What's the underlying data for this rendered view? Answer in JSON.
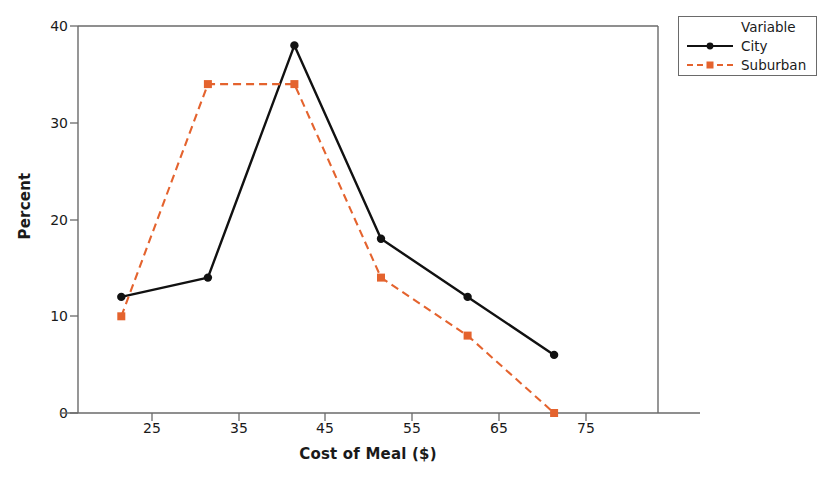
{
  "chart_data": {
    "type": "line",
    "title": "",
    "xlabel": "Cost of Meal ($)",
    "ylabel": "Percent",
    "categories": [
      25,
      35,
      45,
      55,
      65,
      75
    ],
    "x": [
      25,
      35,
      45,
      55,
      65,
      75
    ],
    "xtick_labels": [
      "25",
      "35",
      "45",
      "55",
      "65",
      "75"
    ],
    "ytick_labels": [
      "0",
      "10",
      "20",
      "30",
      "40"
    ],
    "yticks": [
      0,
      10,
      20,
      30,
      40
    ],
    "xlim": [
      20,
      87
    ],
    "ylim": [
      0,
      40
    ],
    "grid": false,
    "legend_position": "top-right outside",
    "legend_title": "Variable",
    "series": [
      {
        "name": "City",
        "values": [
          12,
          14,
          38,
          18,
          12,
          6
        ],
        "color": "#111111",
        "line_style": "solid",
        "marker": "circle"
      },
      {
        "name": "Suburban",
        "values": [
          10,
          34,
          34,
          14,
          8,
          0
        ],
        "color": "#e4632e",
        "line_style": "dashed",
        "marker": "square"
      }
    ]
  },
  "axes": {
    "y_title": "Percent",
    "x_title": "Cost of Meal ($)",
    "y_ticks": [
      "40",
      "30",
      "20",
      "10",
      "0"
    ],
    "x_ticks": [
      "25",
      "35",
      "45",
      "55",
      "65",
      "75"
    ]
  },
  "legend": {
    "header": "Variable",
    "entries": [
      {
        "label": "City"
      },
      {
        "label": "Suburban"
      }
    ]
  },
  "title": {
    "text": ""
  },
  "colors": {
    "city": "#111111",
    "suburban": "#e4632e",
    "frame": "#6a6a6a",
    "text": "#1a1a1a"
  }
}
